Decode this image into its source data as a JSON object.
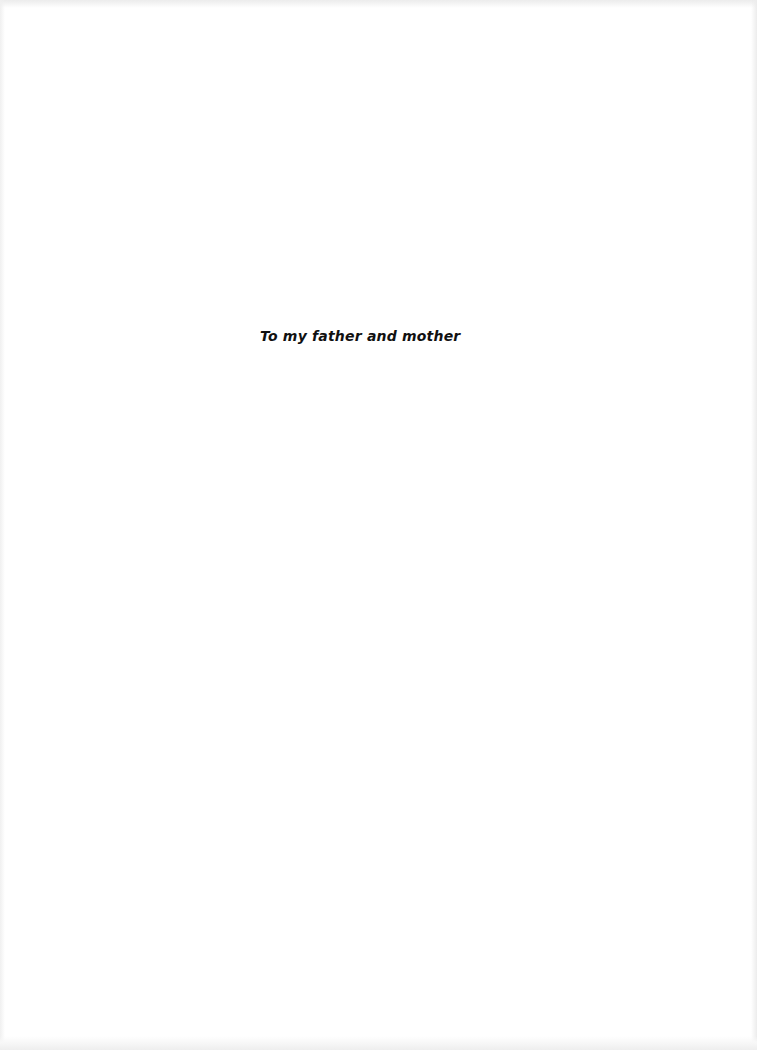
{
  "page": {
    "type": "dedication",
    "dedication_text": "To my father and mother"
  },
  "colors": {
    "background": "#ffffff",
    "text": "#111111"
  }
}
